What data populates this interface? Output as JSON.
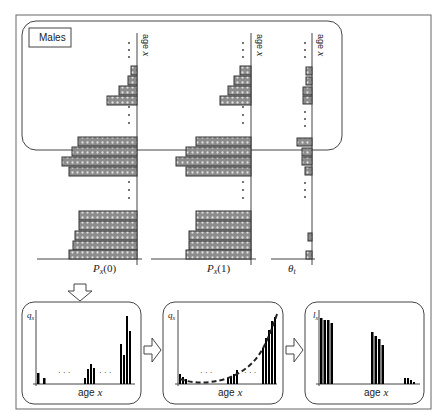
{
  "top_panel": {
    "label": "Males",
    "axis_label": "age",
    "axis_var": "x",
    "columns": [
      {
        "name": "Px(0)",
        "caption": "P",
        "sub": "x",
        "arg": "(0)"
      },
      {
        "name": "Px(1)",
        "caption": "P",
        "sub": "x",
        "arg": "(1)"
      },
      {
        "name": "theta_t",
        "caption": "θ",
        "sub": "t",
        "arg": ""
      }
    ]
  },
  "bottom_panels": [
    {
      "name": "qx-observed",
      "ylabel": "q",
      "ysub": "x",
      "xlabel": "age",
      "xvar": "x"
    },
    {
      "name": "qx-smoothed",
      "ylabel": "q",
      "ysub": "x",
      "xlabel": "age",
      "xvar": "x"
    },
    {
      "name": "lx-survivors",
      "ylabel": "l",
      "ysub": "x",
      "xlabel": "age",
      "xvar": "x"
    }
  ],
  "ellipsis": "· · ·",
  "colors": {
    "bar_fill": "#8a8a8a",
    "bar_stroke": "#333333",
    "line": "#222222",
    "frame": "#555555"
  }
}
